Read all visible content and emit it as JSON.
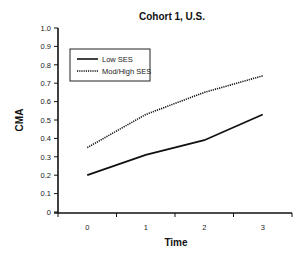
{
  "chart_data": {
    "type": "line",
    "title": "Cohort 1, U.S.",
    "xlabel": "Time",
    "ylabel": "CMA",
    "x": [
      0,
      1,
      2,
      3
    ],
    "x_ticks": [
      "0",
      "1",
      "2",
      "3"
    ],
    "y_ticks": [
      "0",
      "0.1",
      "0.2",
      "0.3",
      "0.4",
      "0.5",
      "0.6",
      "0.7",
      "0.8",
      "0.9",
      "1.0"
    ],
    "ylim": [
      0,
      1.0
    ],
    "grid": false,
    "legend_position": "upper left",
    "series": [
      {
        "name": "Low SES",
        "style": "solid",
        "color": "#111111",
        "values": [
          0.2,
          0.31,
          0.39,
          0.53
        ]
      },
      {
        "name": "Mod/High SES",
        "style": "dotted",
        "color": "#111111",
        "values": [
          0.35,
          0.53,
          0.65,
          0.74
        ]
      }
    ]
  }
}
